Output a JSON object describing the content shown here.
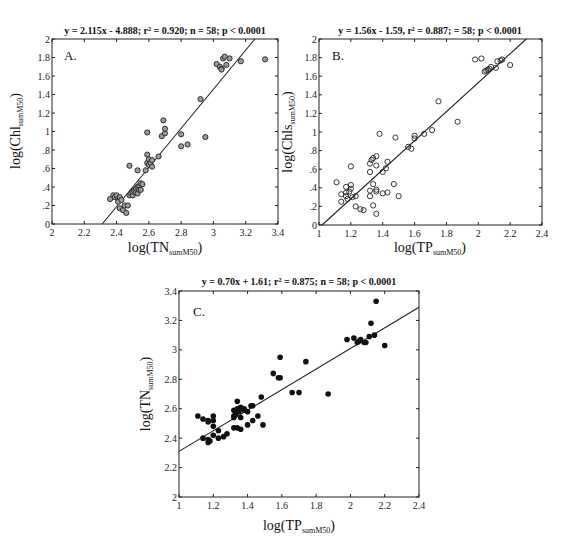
{
  "chart_data": [
    {
      "id": "A",
      "type": "scatter",
      "panel_label": "A.",
      "title": "y = 2.115x - 4.888; r² = 0.920; n = 58; p < 0.0001",
      "xlabel": "log(TN",
      "xlabel_sub": "sumM50",
      "ylabel": "log(Chl",
      "ylabel_sub": "sumM50",
      "xlim": [
        2,
        3.4
      ],
      "ylim": [
        0,
        2
      ],
      "xticks": [
        2,
        2.2,
        2.4,
        2.6,
        2.8,
        3,
        3.2,
        3.4
      ],
      "xtick_labels": [
        "2",
        "2.2",
        "2.4",
        "2.6",
        "2.8",
        "3",
        "3.2",
        "3.4"
      ],
      "yticks": [
        0,
        0.2,
        0.4,
        0.6,
        0.8,
        1,
        1.2,
        1.4,
        1.6,
        1.8,
        2
      ],
      "ytick_labels": [
        "0",
        ".2",
        ".4",
        ".6",
        ".8",
        "1",
        "1.2",
        "1.4",
        "1.6",
        "1.8",
        "2"
      ],
      "marker": "open-circle-gray",
      "fit": {
        "slope": 2.115,
        "intercept": -4.888
      },
      "grid": false,
      "points": [
        [
          2.36,
          0.27
        ],
        [
          2.38,
          0.31
        ],
        [
          2.39,
          0.29
        ],
        [
          2.4,
          0.31
        ],
        [
          2.41,
          0.27
        ],
        [
          2.41,
          0.24
        ],
        [
          2.42,
          0.29
        ],
        [
          2.43,
          0.26
        ],
        [
          2.42,
          0.17
        ],
        [
          2.44,
          0.15
        ],
        [
          2.45,
          0.2
        ],
        [
          2.46,
          0.12
        ],
        [
          2.47,
          0.2
        ],
        [
          2.48,
          0.63
        ],
        [
          2.48,
          0.31
        ],
        [
          2.49,
          0.33
        ],
        [
          2.5,
          0.31
        ],
        [
          2.5,
          0.35
        ],
        [
          2.51,
          0.36
        ],
        [
          2.52,
          0.38
        ],
        [
          2.52,
          0.34
        ],
        [
          2.53,
          0.4
        ],
        [
          2.53,
          0.33
        ],
        [
          2.54,
          0.41
        ],
        [
          2.54,
          0.37
        ],
        [
          2.55,
          0.44
        ],
        [
          2.55,
          0.37
        ],
        [
          2.56,
          0.43
        ],
        [
          2.53,
          0.58
        ],
        [
          2.58,
          0.58
        ],
        [
          2.59,
          0.66
        ],
        [
          2.59,
          0.75
        ],
        [
          2.6,
          0.7
        ],
        [
          2.6,
          0.64
        ],
        [
          2.61,
          0.66
        ],
        [
          2.62,
          0.69
        ],
        [
          2.62,
          0.62
        ],
        [
          2.59,
          0.99
        ],
        [
          2.66,
          0.73
        ],
        [
          2.68,
          0.95
        ],
        [
          2.69,
          1.12
        ],
        [
          2.7,
          0.98
        ],
        [
          2.7,
          1.03
        ],
        [
          2.8,
          0.97
        ],
        [
          2.8,
          0.84
        ],
        [
          2.84,
          0.86
        ],
        [
          2.92,
          1.35
        ],
        [
          2.95,
          0.94
        ],
        [
          3.02,
          1.73
        ],
        [
          3.04,
          1.7
        ],
        [
          3.05,
          1.68
        ],
        [
          3.06,
          1.79
        ],
        [
          3.07,
          1.81
        ],
        [
          3.05,
          1.67
        ],
        [
          3.08,
          1.72
        ],
        [
          3.1,
          1.79
        ],
        [
          3.17,
          1.76
        ],
        [
          3.32,
          1.78
        ]
      ]
    },
    {
      "id": "B",
      "type": "scatter",
      "panel_label": "B.",
      "title": "y = 1.56x - 1.59, r² = 0.887; = 58; p < 0.0001",
      "xlabel": "log(TP",
      "xlabel_sub": "sumM50",
      "ylabel": "log(Chls",
      "ylabel_sub": "sumM50",
      "xlim": [
        1,
        2.4
      ],
      "ylim": [
        0,
        2
      ],
      "xticks": [
        1,
        1.2,
        1.4,
        1.6,
        1.8,
        2,
        2.2,
        2.4
      ],
      "xtick_labels": [
        "1",
        "1.2",
        "1.4",
        "1.6",
        "1.8",
        "2",
        "2.2",
        "2.4"
      ],
      "yticks": [
        0,
        0.2,
        0.4,
        0.6,
        0.8,
        1,
        1.2,
        1.4,
        1.6,
        1.8,
        2
      ],
      "ytick_labels": [
        "0",
        ".2",
        ".4",
        ".6",
        ".8",
        "1",
        "1.2",
        "1.4",
        "1.6",
        "1.8",
        "2"
      ],
      "marker": "open-circle",
      "fit": {
        "slope": 1.56,
        "intercept": -1.59
      },
      "grid": false,
      "points": [
        [
          1.11,
          0.46
        ],
        [
          1.14,
          0.33
        ],
        [
          1.14,
          0.25
        ],
        [
          1.17,
          0.41
        ],
        [
          1.17,
          0.35
        ],
        [
          1.17,
          0.31
        ],
        [
          1.18,
          0.28
        ],
        [
          1.19,
          0.36
        ],
        [
          1.2,
          0.63
        ],
        [
          1.2,
          0.43
        ],
        [
          1.2,
          0.39
        ],
        [
          1.21,
          0.3
        ],
        [
          1.23,
          0.31
        ],
        [
          1.23,
          0.2
        ],
        [
          1.26,
          0.17
        ],
        [
          1.28,
          0.16
        ],
        [
          1.32,
          0.57
        ],
        [
          1.32,
          0.66
        ],
        [
          1.32,
          0.37
        ],
        [
          1.32,
          0.31
        ],
        [
          1.33,
          0.7
        ],
        [
          1.34,
          0.72
        ],
        [
          1.34,
          0.44
        ],
        [
          1.34,
          0.21
        ],
        [
          1.36,
          0.74
        ],
        [
          1.36,
          0.64
        ],
        [
          1.36,
          0.38
        ],
        [
          1.36,
          0.36
        ],
        [
          1.36,
          0.12
        ],
        [
          1.38,
          0.98
        ],
        [
          1.4,
          0.34
        ],
        [
          1.4,
          0.57
        ],
        [
          1.42,
          0.61
        ],
        [
          1.43,
          0.68
        ],
        [
          1.43,
          0.35
        ],
        [
          1.47,
          0.44
        ],
        [
          1.48,
          0.94
        ],
        [
          1.5,
          0.31
        ],
        [
          1.56,
          0.84
        ],
        [
          1.58,
          0.82
        ],
        [
          1.6,
          0.93
        ],
        [
          1.6,
          0.96
        ],
        [
          1.66,
          0.98
        ],
        [
          1.71,
          1.02
        ],
        [
          1.75,
          1.33
        ],
        [
          1.87,
          1.11
        ],
        [
          1.98,
          1.78
        ],
        [
          2.02,
          1.79
        ],
        [
          2.04,
          1.65
        ],
        [
          2.05,
          1.66
        ],
        [
          2.06,
          1.67
        ],
        [
          2.07,
          1.68
        ],
        [
          2.08,
          1.7
        ],
        [
          2.11,
          1.69
        ],
        [
          2.12,
          1.76
        ],
        [
          2.14,
          1.77
        ],
        [
          2.15,
          1.78
        ],
        [
          2.2,
          1.72
        ]
      ]
    },
    {
      "id": "C",
      "type": "scatter",
      "panel_label": "C.",
      "title": "y = 0.70x + 1.61; r² = 0.875; n = 58; p < 0.0001",
      "xlabel": "log(TP",
      "xlabel_sub": "sumM50",
      "ylabel": "log(TN",
      "ylabel_sub": "sumM50",
      "xlim": [
        1,
        2.4
      ],
      "ylim": [
        2,
        3.4
      ],
      "xticks": [
        1,
        1.2,
        1.4,
        1.6,
        1.8,
        2,
        2.2,
        2.4
      ],
      "xtick_labels": [
        "1",
        "1.2",
        "1.4",
        "1.6",
        "1.8",
        "2",
        "2.2",
        "2.4"
      ],
      "yticks": [
        2,
        2.2,
        2.4,
        2.6,
        2.8,
        3,
        3.2,
        3.4
      ],
      "ytick_labels": [
        "2",
        "2.2",
        "2.4",
        "2.6",
        "2.8",
        "3",
        "3.2",
        "3.4"
      ],
      "marker": "filled-circle",
      "fit": {
        "slope": 0.7,
        "intercept": 1.61
      },
      "grid": false,
      "points": [
        [
          1.11,
          2.55
        ],
        [
          1.14,
          2.53
        ],
        [
          1.14,
          2.4
        ],
        [
          1.17,
          2.52
        ],
        [
          1.17,
          2.51
        ],
        [
          1.17,
          2.39
        ],
        [
          1.17,
          2.37
        ],
        [
          1.18,
          2.38
        ],
        [
          1.2,
          2.55
        ],
        [
          1.2,
          2.52
        ],
        [
          1.2,
          2.48
        ],
        [
          1.2,
          2.42
        ],
        [
          1.23,
          2.45
        ],
        [
          1.23,
          2.4
        ],
        [
          1.26,
          2.41
        ],
        [
          1.28,
          2.43
        ],
        [
          1.32,
          2.59
        ],
        [
          1.32,
          2.55
        ],
        [
          1.32,
          2.54
        ],
        [
          1.32,
          2.47
        ],
        [
          1.33,
          2.56
        ],
        [
          1.34,
          2.65
        ],
        [
          1.34,
          2.6
        ],
        [
          1.34,
          2.47
        ],
        [
          1.35,
          2.58
        ],
        [
          1.36,
          2.61
        ],
        [
          1.36,
          2.54
        ],
        [
          1.36,
          2.46
        ],
        [
          1.38,
          2.6
        ],
        [
          1.38,
          2.59
        ],
        [
          1.4,
          2.58
        ],
        [
          1.4,
          2.49
        ],
        [
          1.42,
          2.62
        ],
        [
          1.43,
          2.62
        ],
        [
          1.43,
          2.52
        ],
        [
          1.46,
          2.55
        ],
        [
          1.48,
          2.68
        ],
        [
          1.49,
          2.49
        ],
        [
          1.55,
          2.84
        ],
        [
          1.58,
          2.81
        ],
        [
          1.59,
          2.81
        ],
        [
          1.59,
          2.95
        ],
        [
          1.66,
          2.71
        ],
        [
          1.7,
          2.71
        ],
        [
          1.74,
          2.92
        ],
        [
          1.87,
          2.7
        ],
        [
          1.98,
          3.07
        ],
        [
          2.02,
          3.08
        ],
        [
          2.04,
          3.05
        ],
        [
          2.05,
          3.06
        ],
        [
          2.06,
          3.07
        ],
        [
          2.08,
          3.05
        ],
        [
          2.09,
          3.05
        ],
        [
          2.11,
          3.09
        ],
        [
          2.12,
          3.18
        ],
        [
          2.14,
          3.1
        ],
        [
          2.15,
          3.33
        ],
        [
          2.2,
          3.03
        ]
      ]
    }
  ]
}
